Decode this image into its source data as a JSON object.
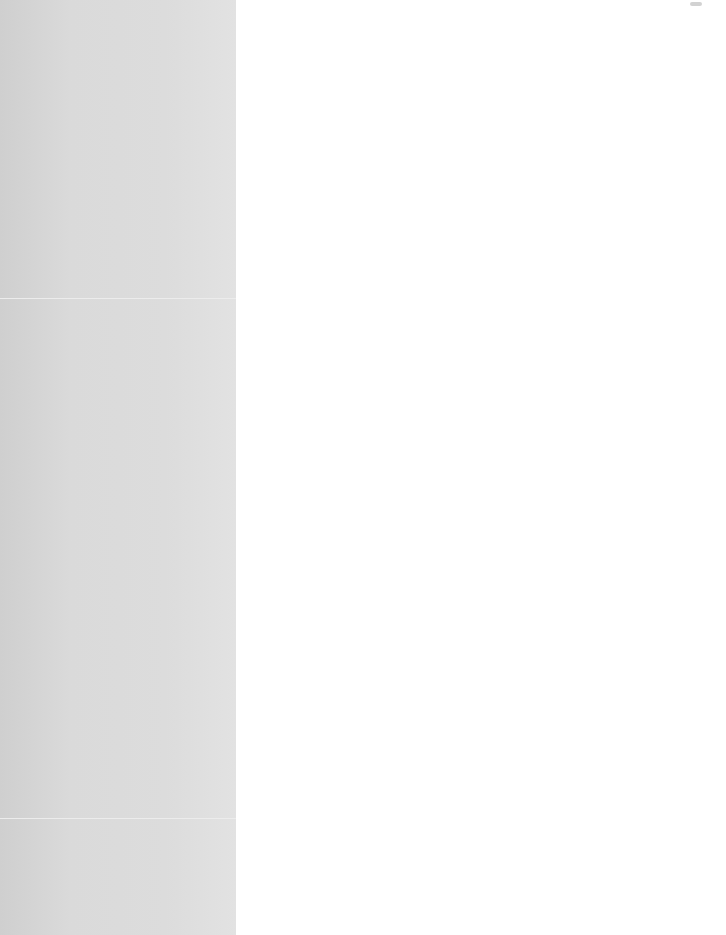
{
  "window": {
    "top_right_indicator": ""
  },
  "sidebar": {
    "sections": [
      {
        "name": "top",
        "top": 0,
        "height": 298
      },
      {
        "name": "middle",
        "top": 299,
        "height": 519
      },
      {
        "name": "bottom",
        "top": 819,
        "height": 116
      }
    ],
    "colors": {
      "background": "#d9d9d9",
      "divider": "#ececec"
    }
  },
  "main": {
    "content": "",
    "colors": {
      "background": "#ffffff"
    }
  }
}
